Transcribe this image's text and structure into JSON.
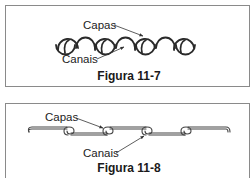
{
  "figures": [
    {
      "id": "11-7",
      "caption": "Figura 11-7",
      "labels": {
        "top": "Capas",
        "bottom": "Canais"
      },
      "style": "interlocking-round"
    },
    {
      "id": "11-8",
      "caption": "Figura 11-8",
      "labels": {
        "top": "Capas",
        "bottom": "Canais"
      },
      "style": "standing-seam-flat"
    }
  ],
  "colors": {
    "frame": "#8a8a8a",
    "stroke": "#2a2a2a",
    "text": "#222222"
  }
}
